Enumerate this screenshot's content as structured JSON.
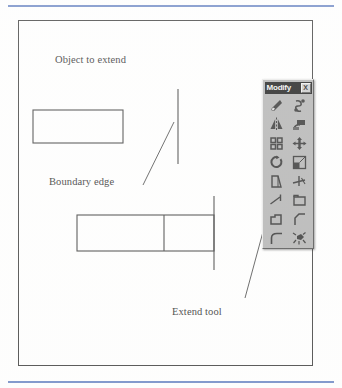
{
  "figure": {
    "labels": {
      "object_to_extend": "Object to extend",
      "boundary_edge": "Boundary edge",
      "extend_tool": "Extend tool"
    },
    "rule_color": "#6b86c4",
    "line_color": "#3a3a3a"
  },
  "toolbar": {
    "title": "Modify",
    "close_label": "X",
    "background_color": "#b0b0b0",
    "titlebar_color": "#121212",
    "tools": [
      {
        "name": "erase-tool",
        "icon": "eraser-icon"
      },
      {
        "name": "copy-tool",
        "icon": "copy-icon"
      },
      {
        "name": "mirror-tool",
        "icon": "mirror-icon"
      },
      {
        "name": "offset-tool",
        "icon": "offset-icon"
      },
      {
        "name": "array-tool",
        "icon": "array-icon"
      },
      {
        "name": "move-tool",
        "icon": "move-arrows-icon"
      },
      {
        "name": "rotate-tool",
        "icon": "rotate-icon"
      },
      {
        "name": "scale-tool",
        "icon": "scale-icon"
      },
      {
        "name": "stretch-tool",
        "icon": "stretch-icon"
      },
      {
        "name": "trim-tool",
        "icon": "trim-icon"
      },
      {
        "name": "extend-tool",
        "icon": "extend-icon"
      },
      {
        "name": "break-at-point-tool",
        "icon": "break-at-point-icon"
      },
      {
        "name": "break-tool",
        "icon": "break-icon"
      },
      {
        "name": "chamfer-tool",
        "icon": "chamfer-icon"
      },
      {
        "name": "fillet-tool",
        "icon": "fillet-icon"
      },
      {
        "name": "explode-tool",
        "icon": "explode-icon"
      }
    ]
  }
}
